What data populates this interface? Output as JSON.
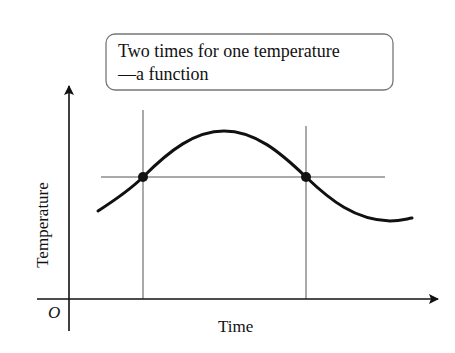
{
  "callout": {
    "line1": "Two times for one temperature",
    "line2": "—a function"
  },
  "axes": {
    "ylabel": "Temperature",
    "xlabel": "Time",
    "origin_label": "O"
  },
  "colors": {
    "curve": "#111111",
    "guide_lines": "#555555",
    "box_border": "#777777"
  },
  "points": [
    {
      "label": "t1",
      "x": 143,
      "y": 177
    },
    {
      "label": "t2",
      "x": 306,
      "y": 177
    }
  ]
}
